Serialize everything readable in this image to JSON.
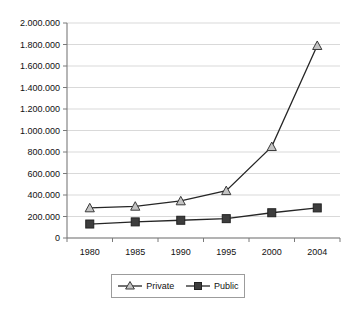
{
  "chart_data": {
    "type": "line",
    "title": "",
    "xlabel": "",
    "ylabel": "",
    "categories": [
      "1980",
      "1985",
      "1990",
      "1995",
      "2000",
      "2004"
    ],
    "series": [
      {
        "name": "Private",
        "marker": "triangle-open",
        "values": [
          280000,
          295000,
          345000,
          440000,
          850000,
          1790000
        ]
      },
      {
        "name": "Public",
        "marker": "square-filled",
        "values": [
          130000,
          150000,
          165000,
          180000,
          235000,
          280000
        ]
      }
    ],
    "ylim": [
      0,
      2000000
    ],
    "ytick_labels": [
      "0",
      "200.000",
      "400.000",
      "600.000",
      "800.000",
      "1.000.000",
      "1.200.000",
      "1.400.000",
      "1.600.000",
      "1.800.000",
      "2.000.000"
    ],
    "ytick_values": [
      0,
      200000,
      400000,
      600000,
      800000,
      1000000,
      1200000,
      1400000,
      1600000,
      1800000,
      2000000
    ],
    "grid": true,
    "legend_position": "bottom",
    "colors": {
      "line": "#262626",
      "grid": "#c8c8c8",
      "axis": "#7a7a7a",
      "private_marker_fill": "#c3c3c3",
      "public_marker_fill": "#3d3d3d",
      "background": "#ffffff"
    }
  },
  "legend": {
    "entries": [
      {
        "label": "Private"
      },
      {
        "label": "Public"
      }
    ]
  }
}
